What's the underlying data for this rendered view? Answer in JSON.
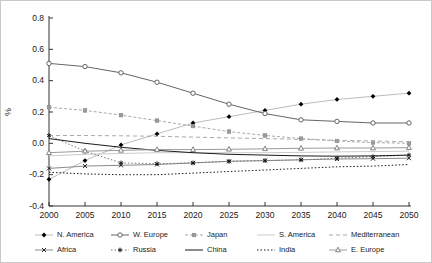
{
  "chart_data": {
    "type": "line",
    "title": "",
    "xlabel": "",
    "ylabel": "%",
    "xlim": [
      2000,
      2050
    ],
    "ylim": [
      -0.4,
      0.8
    ],
    "grid": false,
    "legend_position": "bottom",
    "x": [
      2000,
      2005,
      2010,
      2015,
      2020,
      2025,
      2030,
      2035,
      2040,
      2045,
      2050
    ],
    "xticks": [
      "2000",
      "2005",
      "2010",
      "2015",
      "2020",
      "2025",
      "2030",
      "2035",
      "2040",
      "2045",
      "2050"
    ],
    "yticks": [
      "0.8",
      "0.6",
      "0.4",
      "0.2",
      "0.0",
      "-0.2",
      "-0.4"
    ],
    "ytick_values": [
      0.8,
      0.6,
      0.4,
      0.2,
      0.0,
      -0.2,
      -0.4
    ],
    "axis_color": "#333333",
    "series": [
      {
        "name": "N. America",
        "marker": "diamond",
        "marker_color": "#000000",
        "line_color": "#bdbdbd",
        "dash": "solid",
        "values": [
          -0.23,
          -0.11,
          -0.01,
          0.06,
          0.13,
          0.17,
          0.21,
          0.25,
          0.28,
          0.3,
          0.32
        ]
      },
      {
        "name": "W. Europe",
        "marker": "circle",
        "marker_color": "#555555",
        "line_color": "#666666",
        "dash": "solid",
        "values": [
          0.51,
          0.49,
          0.45,
          0.39,
          0.32,
          0.25,
          0.19,
          0.15,
          0.14,
          0.13,
          0.13
        ]
      },
      {
        "name": "Japan",
        "marker": "square",
        "marker_color": "#999999",
        "line_color": "#aaaaaa",
        "dash": "dash",
        "values": [
          0.23,
          0.21,
          0.18,
          0.145,
          0.11,
          0.075,
          0.05,
          0.03,
          0.015,
          0.005,
          0.0
        ]
      },
      {
        "name": "S. America",
        "marker": "none",
        "marker_color": "#cccccc",
        "line_color": "#cccccc",
        "dash": "solid",
        "values": [
          -0.08,
          -0.07,
          -0.065,
          -0.06,
          -0.06,
          -0.06,
          -0.06,
          -0.058,
          -0.055,
          -0.052,
          -0.05
        ]
      },
      {
        "name": "Mediterranean",
        "marker": "none",
        "marker_color": "#aaaaaa",
        "line_color": "#aaaaaa",
        "dash": "longdash",
        "values": [
          0.05,
          0.05,
          0.048,
          0.045,
          0.04,
          0.035,
          0.03,
          0.025,
          0.02,
          0.015,
          0.01
        ]
      },
      {
        "name": "Africa",
        "marker": "x",
        "marker_color": "#111111",
        "line_color": "#8a8a8a",
        "dash": "solid",
        "values": [
          -0.16,
          -0.145,
          -0.14,
          -0.135,
          -0.125,
          -0.115,
          -0.11,
          -0.105,
          -0.1,
          -0.098,
          -0.095
        ]
      },
      {
        "name": "Russia",
        "marker": "star",
        "marker_color": "#111111",
        "line_color": "#777777",
        "dash": "dot",
        "values": [
          0.05,
          -0.05,
          -0.125,
          -0.13,
          -0.125,
          -0.115,
          -0.11,
          -0.105,
          -0.095,
          -0.085,
          -0.075
        ]
      },
      {
        "name": "China",
        "marker": "none",
        "marker_color": "#000000",
        "line_color": "#1a1a1a",
        "dash": "solid",
        "values": [
          0.03,
          0.0,
          -0.025,
          -0.045,
          -0.06,
          -0.07,
          -0.075,
          -0.08,
          -0.082,
          -0.08,
          -0.075
        ]
      },
      {
        "name": "India",
        "marker": "none",
        "marker_color": "#000000",
        "line_color": "#1a1a1a",
        "dash": "dot",
        "values": [
          -0.185,
          -0.195,
          -0.2,
          -0.2,
          -0.19,
          -0.18,
          -0.17,
          -0.16,
          -0.15,
          -0.145,
          -0.135
        ]
      },
      {
        "name": "E. Europe",
        "marker": "triangle",
        "marker_color": "#777777",
        "line_color": "#9a9a9a",
        "dash": "solid",
        "values": [
          -0.06,
          -0.05,
          -0.045,
          -0.04,
          -0.04,
          -0.038,
          -0.035,
          -0.032,
          -0.03,
          -0.03,
          -0.028
        ]
      }
    ]
  }
}
